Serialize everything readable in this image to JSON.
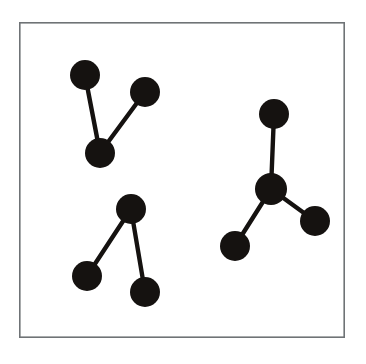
{
  "figure": {
    "title": "",
    "canvas": {
      "width": 366,
      "height": 364,
      "background": "#ffffff"
    },
    "frame": {
      "name": "plot-border",
      "x": 19,
      "y": 22,
      "width": 326,
      "height": 316,
      "stroke_color": "#6f7376",
      "stroke_width": 1.6,
      "fill": "#ffffff"
    },
    "style": {
      "node_color": "#151210",
      "node_radius": 15,
      "edge_color": "#151210",
      "edge_width": 4.4
    }
  },
  "graph": {
    "type": "node-link-diagram",
    "node_count": 10,
    "edge_count": 7,
    "component_count": 3,
    "nodes": [
      {
        "id": "n1",
        "label": "",
        "cluster": "top-left",
        "cx": 85,
        "cy": 75,
        "r": 15
      },
      {
        "id": "n2",
        "label": "",
        "cluster": "top-left",
        "cx": 145,
        "cy": 92,
        "r": 15
      },
      {
        "id": "n3",
        "label": "",
        "cluster": "top-left",
        "cx": 100,
        "cy": 153,
        "r": 15
      },
      {
        "id": "n4",
        "label": "",
        "cluster": "bottom-left",
        "cx": 131,
        "cy": 209,
        "r": 15
      },
      {
        "id": "n5",
        "label": "",
        "cluster": "bottom-left",
        "cx": 87,
        "cy": 276,
        "r": 15
      },
      {
        "id": "n6",
        "label": "",
        "cluster": "bottom-left",
        "cx": 145,
        "cy": 292,
        "r": 15
      },
      {
        "id": "n7",
        "label": "",
        "cluster": "right",
        "cx": 274,
        "cy": 114,
        "r": 15
      },
      {
        "id": "n8",
        "label": "",
        "cluster": "right",
        "cx": 271,
        "cy": 189,
        "r": 16
      },
      {
        "id": "n9",
        "label": "",
        "cluster": "right",
        "cx": 315,
        "cy": 221,
        "r": 15
      },
      {
        "id": "n10",
        "label": "",
        "cluster": "right",
        "cx": 235,
        "cy": 246,
        "r": 15
      }
    ],
    "edges": [
      {
        "id": "e1",
        "source": "n1",
        "target": "n3",
        "cluster": "top-left"
      },
      {
        "id": "e2",
        "source": "n3",
        "target": "n2",
        "cluster": "top-left"
      },
      {
        "id": "e3",
        "source": "n4",
        "target": "n5",
        "cluster": "bottom-left"
      },
      {
        "id": "e4",
        "source": "n4",
        "target": "n6",
        "cluster": "bottom-left"
      },
      {
        "id": "e5",
        "source": "n7",
        "target": "n8",
        "cluster": "right"
      },
      {
        "id": "e6",
        "source": "n8",
        "target": "n9",
        "cluster": "right"
      },
      {
        "id": "e7",
        "source": "n8",
        "target": "n10",
        "cluster": "right"
      }
    ],
    "clusters": [
      {
        "id": "top-left",
        "shape": "V",
        "nodes": [
          "n1",
          "n2",
          "n3"
        ]
      },
      {
        "id": "bottom-left",
        "shape": "lambda",
        "nodes": [
          "n4",
          "n5",
          "n6"
        ]
      },
      {
        "id": "right",
        "shape": "Y",
        "nodes": [
          "n7",
          "n8",
          "n9",
          "n10"
        ]
      }
    ]
  }
}
